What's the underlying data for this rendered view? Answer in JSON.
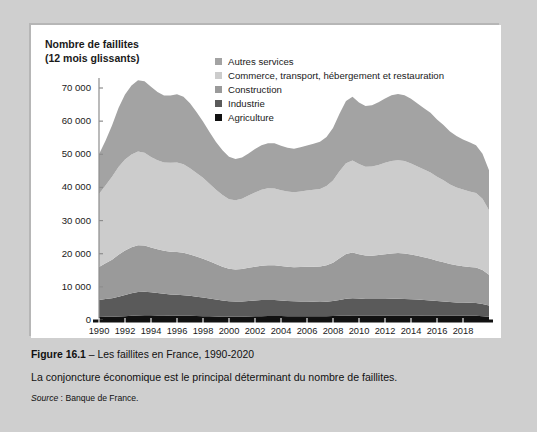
{
  "panel": {
    "axis_title": "Nombre de faillites\n(12 mois glissants)"
  },
  "legend": {
    "items": [
      {
        "label": "Autres services",
        "color": "#a3a3a3"
      },
      {
        "label": "Commerce, transport, hébergement et restauration",
        "color": "#cccccc"
      },
      {
        "label": "Construction",
        "color": "#9a9a9a"
      },
      {
        "label": "Industrie",
        "color": "#5a5a5a"
      },
      {
        "label": "Agriculture",
        "color": "#111111"
      }
    ]
  },
  "caption": {
    "figure_number": "Figure 16.1",
    "figure_title": " – Les faillites en France, 1990-2020",
    "description": "La conjoncture économique est le principal déterminant du nombre de faillites.",
    "source_word": "Source",
    "source_text": " : Banque de France."
  },
  "chart_data": {
    "type": "area",
    "stacked": true,
    "title": "Nombre de faillites (12 mois glissants)",
    "xlabel": "",
    "ylabel": "Nombre de faillites (12 mois glissants)",
    "xlim": [
      1990,
      2020
    ],
    "ylim": [
      0,
      70000
    ],
    "ytick_values": [
      0,
      10000,
      20000,
      30000,
      40000,
      50000,
      60000,
      70000
    ],
    "ytick_labels": [
      "0",
      "10 000",
      "20 000",
      "30 000",
      "40 000",
      "50 000",
      "60 000",
      "70 000"
    ],
    "xtick_values": [
      1990,
      1992,
      1994,
      1996,
      1998,
      2000,
      2002,
      2004,
      2006,
      2008,
      2010,
      2012,
      2014,
      2016,
      2018
    ],
    "xtick_labels": [
      "1990",
      "1992",
      "1994",
      "1996",
      "1998",
      "2000",
      "2002",
      "2004",
      "2006",
      "2008",
      "2010",
      "2012",
      "2014",
      "2016",
      "2018"
    ],
    "grid": false,
    "legend_position": "top-right",
    "x": [
      1990,
      1990.5,
      1991,
      1991.5,
      1992,
      1992.5,
      1993,
      1993.5,
      1994,
      1994.5,
      1995,
      1995.5,
      1996,
      1996.5,
      1997,
      1997.5,
      1998,
      1998.5,
      1999,
      1999.5,
      2000,
      2000.5,
      2001,
      2001.5,
      2002,
      2002.5,
      2003,
      2003.5,
      2004,
      2004.5,
      2005,
      2005.5,
      2006,
      2006.5,
      2007,
      2007.5,
      2008,
      2008.5,
      2009,
      2009.5,
      2010,
      2010.5,
      2011,
      2011.5,
      2012,
      2012.5,
      2013,
      2013.5,
      2014,
      2014.5,
      2015,
      2015.5,
      2016,
      2016.5,
      2017,
      2017.5,
      2018,
      2018.5,
      2019,
      2019.5,
      2020
    ],
    "series": [
      {
        "name": "Agriculture",
        "color": "#111111",
        "values": [
          900,
          950,
          1000,
          1050,
          1150,
          1250,
          1350,
          1400,
          1400,
          1380,
          1350,
          1320,
          1300,
          1280,
          1250,
          1200,
          1150,
          1100,
          1050,
          1000,
          950,
          950,
          1000,
          1050,
          1100,
          1150,
          1200,
          1200,
          1180,
          1150,
          1150,
          1150,
          1150,
          1150,
          1150,
          1150,
          1200,
          1250,
          1300,
          1350,
          1350,
          1350,
          1350,
          1350,
          1350,
          1350,
          1350,
          1350,
          1350,
          1350,
          1300,
          1300,
          1250,
          1250,
          1250,
          1250,
          1250,
          1250,
          1250,
          1150,
          1000
        ]
      },
      {
        "name": "Industrie",
        "color": "#5a5a5a",
        "values": [
          5100,
          5350,
          5600,
          6000,
          6400,
          6800,
          7100,
          7150,
          7000,
          6800,
          6550,
          6400,
          6300,
          6200,
          6050,
          5850,
          5650,
          5400,
          5150,
          4900,
          4700,
          4600,
          4600,
          4700,
          4800,
          4850,
          4850,
          4800,
          4700,
          4600,
          4500,
          4450,
          4400,
          4350,
          4300,
          4350,
          4500,
          4800,
          5100,
          5200,
          5100,
          5000,
          4950,
          4950,
          5000,
          5050,
          5050,
          5000,
          4900,
          4800,
          4700,
          4600,
          4450,
          4300,
          4150,
          4050,
          4000,
          3950,
          3900,
          3700,
          3350
        ]
      },
      {
        "name": "Construction",
        "color": "#9a9a9a",
        "values": [
          10000,
          10800,
          11600,
          12600,
          13400,
          13900,
          14100,
          13900,
          13500,
          13200,
          13000,
          12900,
          12900,
          12800,
          12500,
          12100,
          11700,
          11200,
          10700,
          10200,
          9800,
          9700,
          9800,
          10000,
          10200,
          10400,
          10500,
          10500,
          10400,
          10300,
          10300,
          10400,
          10500,
          10600,
          10700,
          11000,
          11600,
          12600,
          13500,
          13800,
          13400,
          13100,
          13100,
          13300,
          13500,
          13700,
          13800,
          13700,
          13500,
          13200,
          12900,
          12600,
          12200,
          11900,
          11500,
          11200,
          11000,
          10800,
          10700,
          10200,
          9300
        ]
      },
      {
        "name": "Commerce, transport, hébergement et restauration",
        "color": "#cccccc",
        "values": [
          22000,
          23500,
          25000,
          26500,
          27500,
          28000,
          28300,
          28000,
          27300,
          26800,
          26600,
          26800,
          27000,
          26700,
          26000,
          25200,
          24400,
          23400,
          22400,
          21600,
          21000,
          20900,
          21200,
          21800,
          22400,
          22900,
          23200,
          23200,
          22900,
          22700,
          22600,
          22800,
          23000,
          23200,
          23400,
          23900,
          24800,
          26200,
          27400,
          27800,
          27200,
          26800,
          26900,
          27200,
          27600,
          27900,
          28000,
          27900,
          27500,
          27000,
          26500,
          26000,
          25300,
          24700,
          24000,
          23500,
          23100,
          22800,
          22500,
          21500,
          19500
        ]
      },
      {
        "name": "Autres services",
        "color": "#a3a3a3",
        "values": [
          12000,
          13500,
          15500,
          17800,
          19600,
          20800,
          21500,
          21600,
          21200,
          20600,
          20200,
          20300,
          20600,
          20400,
          19600,
          18400,
          17000,
          15600,
          14400,
          13500,
          12800,
          12400,
          12400,
          12700,
          13100,
          13400,
          13600,
          13600,
          13400,
          13200,
          13100,
          13300,
          13600,
          13900,
          14200,
          14800,
          15800,
          17400,
          18800,
          19200,
          18600,
          18300,
          18500,
          18900,
          19400,
          19800,
          20000,
          19900,
          19500,
          19000,
          18500,
          18000,
          17300,
          16700,
          16000,
          15500,
          15100,
          14800,
          14400,
          13600,
          12000
        ]
      }
    ]
  }
}
